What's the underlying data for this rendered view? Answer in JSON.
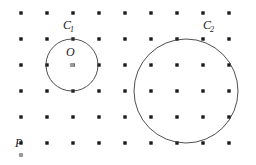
{
  "figure": {
    "width": 256,
    "height": 165,
    "background_color": "#ffffff"
  },
  "colors": {
    "lattice_dot": "#1a1a1a",
    "highlight_dot": "#9a9a9a",
    "circle_stroke": "#3c3c3c",
    "label_text": "#1a1a1a"
  },
  "lattice": {
    "description": "square grid of points",
    "origin_x": 21,
    "origin_y": 13,
    "spacing_x": 26,
    "spacing_y": 26,
    "columns": 9,
    "rows": 6,
    "dot_radius": 1.7,
    "dot_shape": "square"
  },
  "circles": [
    {
      "id": "C1",
      "label": "C",
      "subscript": "1",
      "cx": 72,
      "cy": 65,
      "r": 26,
      "label_x": 63,
      "label_y": 29,
      "sub_dx": 7,
      "sub_dy": 3
    },
    {
      "id": "C2",
      "label": "C",
      "subscript": "2",
      "cx": 186,
      "cy": 91,
      "r": 52,
      "label_x": 203,
      "label_y": 29,
      "sub_dx": 7,
      "sub_dy": 3
    }
  ],
  "highlight_points": [
    {
      "id": "O",
      "label": "O",
      "cx": 72,
      "cy": 65,
      "label_x": 66,
      "label_y": 56,
      "dot_radius": 2.1
    },
    {
      "id": "P",
      "label": "P",
      "cx": 21,
      "cy": 155,
      "label_x": 15,
      "label_y": 147,
      "dot_radius": 2.1
    }
  ]
}
